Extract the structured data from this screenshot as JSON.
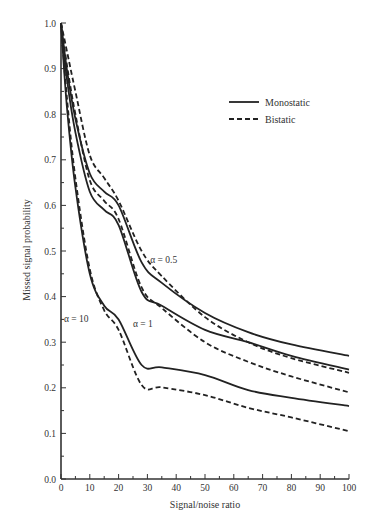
{
  "chart_data": {
    "type": "line",
    "title": "",
    "xlabel": "Signal/noise ratio",
    "ylabel": "Missed signal probability",
    "xlim": [
      0,
      100
    ],
    "ylim": [
      0.0,
      1.0
    ],
    "x_ticks": [
      0,
      10,
      20,
      30,
      40,
      50,
      60,
      70,
      80,
      90,
      100
    ],
    "y_ticks": [
      0.0,
      0.1,
      0.2,
      0.3,
      0.4,
      0.5,
      0.6,
      0.7,
      0.8,
      0.9,
      1.0
    ],
    "x_tick_labels": [
      "0",
      "10",
      "20",
      "30",
      "40",
      "50",
      "60",
      "70",
      "80",
      "90",
      "100"
    ],
    "y_tick_labels": [
      "0.0",
      "0.1",
      "0.2",
      "0.3",
      "0.4",
      "0.5",
      "0.6",
      "0.7",
      "0.8",
      "0.9",
      "1.0"
    ],
    "grid": false,
    "legend_position": "upper right",
    "legend": [
      {
        "label": "Monostatic",
        "style": "solid"
      },
      {
        "label": "Bistatic",
        "style": "dashed"
      }
    ],
    "annotations": [
      {
        "text": "α = 0.5",
        "x": 31,
        "y": 0.48
      },
      {
        "text": "α = 1",
        "x": 25,
        "y": 0.34
      },
      {
        "text": "α = 10",
        "x": 1,
        "y": 0.35
      }
    ],
    "x": [
      0,
      2,
      5,
      10,
      15,
      20,
      28,
      35,
      50,
      65,
      80,
      100
    ],
    "series": [
      {
        "name": "Monostatic α = 0.5",
        "style": "solid",
        "values": [
          1.0,
          0.9,
          0.79,
          0.67,
          0.63,
          0.6,
          0.475,
          0.43,
          0.364,
          0.322,
          0.295,
          0.27
        ]
      },
      {
        "name": "Bistatic α = 0.5",
        "style": "dashed",
        "values": [
          1.0,
          0.94,
          0.85,
          0.71,
          0.66,
          0.61,
          0.5,
          0.445,
          0.355,
          0.3,
          0.265,
          0.233
        ]
      },
      {
        "name": "Monostatic α = 1",
        "style": "solid",
        "values": [
          1.0,
          0.88,
          0.76,
          0.63,
          0.59,
          0.557,
          0.41,
          0.38,
          0.327,
          0.3,
          0.27,
          0.24
        ]
      },
      {
        "name": "Bistatic α = 1",
        "style": "dashed",
        "values": [
          1.0,
          0.91,
          0.8,
          0.655,
          0.61,
          0.57,
          0.42,
          0.375,
          0.3,
          0.257,
          0.225,
          0.19
        ]
      },
      {
        "name": "Monostatic α = 10",
        "style": "solid",
        "values": [
          1.0,
          0.82,
          0.64,
          0.45,
          0.38,
          0.35,
          0.25,
          0.255,
          0.228,
          0.195,
          0.178,
          0.16
        ]
      },
      {
        "name": "Bistatic α = 10",
        "style": "dashed",
        "values": [
          1.0,
          0.84,
          0.66,
          0.46,
          0.37,
          0.327,
          0.206,
          0.235,
          0.184,
          0.156,
          0.135,
          0.105
        ]
      }
    ]
  }
}
